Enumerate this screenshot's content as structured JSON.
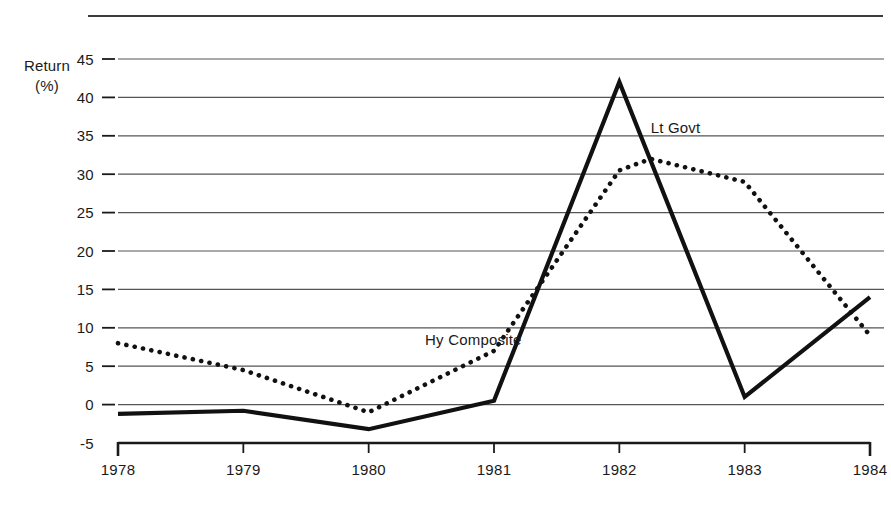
{
  "chart_data": {
    "type": "line",
    "title": "",
    "subtitle": "",
    "xlabel": "",
    "ylabel": "Return (%)",
    "ylabel_lines": [
      "Return",
      "(%)"
    ],
    "x": [
      1978,
      1979,
      1980,
      1981,
      1982,
      1983,
      1984
    ],
    "xlim": [
      1978,
      1984
    ],
    "ylim": [
      -5,
      45
    ],
    "x_tick_labels": [
      "1978",
      "1979",
      "1980",
      "1981",
      "1982",
      "1983",
      "1984"
    ],
    "y_tick_labels": [
      "45",
      "40",
      "35",
      "30",
      "25",
      "20",
      "15",
      "10",
      "5",
      "0",
      "-5"
    ],
    "y_ticks": [
      45,
      40,
      35,
      30,
      25,
      20,
      15,
      10,
      5,
      0,
      -5
    ],
    "grid": true,
    "grid_axis": "y",
    "legend_position": "inline-annotation",
    "series": [
      {
        "name": "Lt Govt",
        "style": "solid",
        "color": "#111111",
        "label_x": 1982.25,
        "label_y": 36,
        "values": [
          -1.2,
          -0.8,
          -3.2,
          0.5,
          42,
          1,
          14
        ]
      },
      {
        "name": "Hy Composite",
        "style": "dotted",
        "color": "#111111",
        "label_x": 1980.45,
        "label_y": 8.4,
        "x": [
          1978,
          1979,
          1980,
          1981,
          1982,
          1982.25,
          1983,
          1984
        ],
        "values": [
          8,
          4.5,
          -1,
          7,
          30.5,
          32,
          29,
          9
        ]
      }
    ],
    "annotations": [
      {
        "text": "Lt Govt",
        "x": 1982.25,
        "y": 36
      },
      {
        "text": "Hy Composite",
        "x": 1980.45,
        "y": 8.4
      }
    ]
  }
}
